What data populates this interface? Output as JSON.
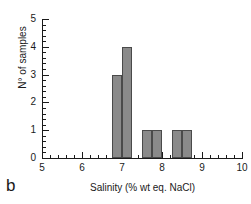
{
  "panel": {
    "label": "b"
  },
  "chart_data": {
    "type": "bar",
    "title": "",
    "subtitle": "",
    "xlabel": "Salinity (% wt eq. NaCl)",
    "ylabel": "N° of samples",
    "xlim": [
      5,
      10
    ],
    "ylim": [
      0,
      5
    ],
    "x_major_ticks": [
      5,
      6,
      7,
      8,
      9,
      10
    ],
    "x_tick_labels": [
      "5",
      "6",
      "7",
      "8",
      "9",
      "10"
    ],
    "x_minor_tick_step": 0.2,
    "y_major_ticks": [
      0,
      1,
      2,
      3,
      4,
      5
    ],
    "y_tick_labels": [
      "0",
      "1",
      "2",
      "3",
      "4",
      "5"
    ],
    "y_minor_tick_step": 0.2,
    "grid": false,
    "legend": null,
    "bin_width": 0.25,
    "bar_color": "#8a8a8a",
    "bar_edge_color": "#4a4a4a",
    "axis_color": "#1a1a1a",
    "background_color": "#ffffff",
    "bins": [
      {
        "x_start": 6.75,
        "x_end": 7.0,
        "value": 3
      },
      {
        "x_start": 7.0,
        "x_end": 7.25,
        "value": 4
      },
      {
        "x_start": 7.5,
        "x_end": 7.75,
        "value": 1
      },
      {
        "x_start": 7.75,
        "x_end": 8.0,
        "value": 1
      },
      {
        "x_start": 8.25,
        "x_end": 8.5,
        "value": 1
      },
      {
        "x_start": 8.5,
        "x_end": 8.75,
        "value": 1
      }
    ],
    "categories": [
      "6.75-7.00",
      "7.00-7.25",
      "7.50-7.75",
      "7.75-8.00",
      "8.25-8.50",
      "8.50-8.75"
    ],
    "values": [
      3,
      4,
      1,
      1,
      1,
      1
    ],
    "total_samples": 11
  }
}
